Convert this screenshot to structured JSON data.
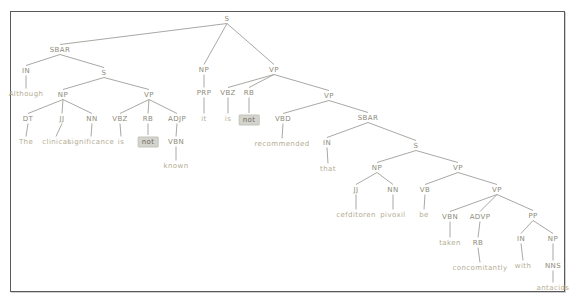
{
  "diagram": {
    "type": "constituency-parse-tree",
    "sentence": "Although The clinical significance is not known it is not recommended that cefditoren pivoxil be taken concomitantly with antacids",
    "highlighted_words": [
      "not",
      "not"
    ],
    "colors": {
      "phrase_label": "#8d8a79",
      "leaf_word": "#b4ac93",
      "highlight_background": "#d4d4cf",
      "highlight_text": "#6e6857",
      "edge": "#a8a8a4",
      "frame_border": "#5a5a5a",
      "background": "#ffffff"
    },
    "nodes": [
      {
        "id": "s-root",
        "label": "S",
        "kind": "phrase",
        "x": 227,
        "y": 19,
        "parent": null
      },
      {
        "id": "sbar-1",
        "label": "SBAR",
        "kind": "phrase",
        "x": 60,
        "y": 50,
        "parent": "s-root"
      },
      {
        "id": "np-it",
        "label": "NP",
        "kind": "phrase",
        "x": 204,
        "y": 70,
        "parent": "s-root"
      },
      {
        "id": "vp-main",
        "label": "VP",
        "kind": "phrase",
        "x": 274,
        "y": 70,
        "parent": "s-root"
      },
      {
        "id": "in-1",
        "label": "IN",
        "kind": "pos",
        "x": 26,
        "y": 71,
        "parent": "sbar-1"
      },
      {
        "id": "s-1",
        "label": "S",
        "kind": "phrase",
        "x": 104,
        "y": 73,
        "parent": "sbar-1"
      },
      {
        "id": "w-although",
        "label": "Although",
        "kind": "word",
        "x": 26,
        "y": 94,
        "parent": "in-1"
      },
      {
        "id": "np-1",
        "label": "NP",
        "kind": "phrase",
        "x": 63,
        "y": 95,
        "parent": "s-1"
      },
      {
        "id": "vp-1",
        "label": "VP",
        "kind": "phrase",
        "x": 149,
        "y": 95,
        "parent": "s-1"
      },
      {
        "id": "dt-1",
        "label": "DT",
        "kind": "pos",
        "x": 28,
        "y": 119,
        "parent": "np-1"
      },
      {
        "id": "jj-1",
        "label": "JJ",
        "kind": "pos",
        "x": 62,
        "y": 119,
        "parent": "np-1"
      },
      {
        "id": "nn-1",
        "label": "NN",
        "kind": "pos",
        "x": 92,
        "y": 119,
        "parent": "np-1"
      },
      {
        "id": "w-the",
        "label": "The",
        "kind": "word",
        "x": 26,
        "y": 142,
        "parent": "dt-1"
      },
      {
        "id": "w-clinical",
        "label": "clinical",
        "kind": "word",
        "x": 56,
        "y": 142,
        "parent": "jj-1"
      },
      {
        "id": "w-significance",
        "label": "significance",
        "kind": "word",
        "x": 91,
        "y": 142,
        "parent": "nn-1"
      },
      {
        "id": "vbz-1",
        "label": "VBZ",
        "kind": "pos",
        "x": 120,
        "y": 119,
        "parent": "vp-1"
      },
      {
        "id": "rb-1",
        "label": "RB",
        "kind": "pos",
        "x": 148,
        "y": 119,
        "parent": "vp-1"
      },
      {
        "id": "adjp-1",
        "label": "ADJP",
        "kind": "phrase",
        "x": 177,
        "y": 119,
        "parent": "vp-1"
      },
      {
        "id": "w-is-1",
        "label": "is",
        "kind": "word",
        "x": 121,
        "y": 142,
        "parent": "vbz-1"
      },
      {
        "id": "w-not-1",
        "label": "not",
        "kind": "word",
        "x": 148,
        "y": 142,
        "parent": "rb-1",
        "highlight": true
      },
      {
        "id": "vbn-1",
        "label": "VBN",
        "kind": "pos",
        "x": 176,
        "y": 142,
        "parent": "adjp-1"
      },
      {
        "id": "w-known",
        "label": "known",
        "kind": "word",
        "x": 176,
        "y": 166,
        "parent": "vbn-1"
      },
      {
        "id": "prp-1",
        "label": "PRP",
        "kind": "pos",
        "x": 204,
        "y": 93,
        "parent": "np-it"
      },
      {
        "id": "w-it",
        "label": "it",
        "kind": "word",
        "x": 204,
        "y": 119,
        "parent": "prp-1"
      },
      {
        "id": "vbz-2",
        "label": "VBZ",
        "kind": "pos",
        "x": 228,
        "y": 93,
        "parent": "vp-main"
      },
      {
        "id": "rb-2",
        "label": "RB",
        "kind": "pos",
        "x": 249,
        "y": 93,
        "parent": "vp-main"
      },
      {
        "id": "vp-2",
        "label": "VP",
        "kind": "phrase",
        "x": 329,
        "y": 96,
        "parent": "vp-main"
      },
      {
        "id": "w-is-2",
        "label": "is",
        "kind": "word",
        "x": 228,
        "y": 119,
        "parent": "vbz-2"
      },
      {
        "id": "w-not-2",
        "label": "not",
        "kind": "word",
        "x": 249,
        "y": 120,
        "parent": "rb-2",
        "highlight": true
      },
      {
        "id": "vbd-1",
        "label": "VBD",
        "kind": "pos",
        "x": 283,
        "y": 119,
        "parent": "vp-2"
      },
      {
        "id": "sbar-2",
        "label": "SBAR",
        "kind": "phrase",
        "x": 368,
        "y": 118,
        "parent": "vp-2"
      },
      {
        "id": "w-recommended",
        "label": "recommended",
        "kind": "word",
        "x": 282,
        "y": 144,
        "parent": "vbd-1"
      },
      {
        "id": "in-2",
        "label": "IN",
        "kind": "pos",
        "x": 327,
        "y": 143,
        "parent": "sbar-2"
      },
      {
        "id": "s-2",
        "label": "S",
        "kind": "phrase",
        "x": 416,
        "y": 146,
        "parent": "sbar-2"
      },
      {
        "id": "w-that",
        "label": "that",
        "kind": "word",
        "x": 328,
        "y": 169,
        "parent": "in-2"
      },
      {
        "id": "np-2",
        "label": "NP",
        "kind": "phrase",
        "x": 377,
        "y": 168,
        "parent": "s-2"
      },
      {
        "id": "vp-3",
        "label": "VP",
        "kind": "phrase",
        "x": 458,
        "y": 168,
        "parent": "s-2"
      },
      {
        "id": "jj-2",
        "label": "JJ",
        "kind": "pos",
        "x": 356,
        "y": 190,
        "parent": "np-2"
      },
      {
        "id": "nn-2",
        "label": "NN",
        "kind": "pos",
        "x": 393,
        "y": 190,
        "parent": "np-2"
      },
      {
        "id": "w-cefditoren",
        "label": "cefditoren",
        "kind": "word",
        "x": 356,
        "y": 215,
        "parent": "jj-2"
      },
      {
        "id": "w-pivoxil",
        "label": "pivoxil",
        "kind": "word",
        "x": 393,
        "y": 215,
        "parent": "nn-2"
      },
      {
        "id": "vb-1",
        "label": "VB",
        "kind": "pos",
        "x": 425,
        "y": 190,
        "parent": "vp-3"
      },
      {
        "id": "vp-4",
        "label": "VP",
        "kind": "phrase",
        "x": 497,
        "y": 190,
        "parent": "vp-3"
      },
      {
        "id": "w-be",
        "label": "be",
        "kind": "word",
        "x": 424,
        "y": 215,
        "parent": "vb-1"
      },
      {
        "id": "vbn-2",
        "label": "VBN",
        "kind": "pos",
        "x": 450,
        "y": 217,
        "parent": "vp-4"
      },
      {
        "id": "advp-1",
        "label": "ADVP",
        "kind": "phrase",
        "x": 480,
        "y": 217,
        "parent": "vp-4"
      },
      {
        "id": "pp-1",
        "label": "PP",
        "kind": "phrase",
        "x": 533,
        "y": 216,
        "parent": "vp-4"
      },
      {
        "id": "w-taken",
        "label": "taken",
        "kind": "word",
        "x": 450,
        "y": 243,
        "parent": "vbn-2"
      },
      {
        "id": "rb-3",
        "label": "RB",
        "kind": "pos",
        "x": 478,
        "y": 243,
        "parent": "advp-1"
      },
      {
        "id": "w-concomitantly",
        "label": "concomitantly",
        "kind": "word",
        "x": 480,
        "y": 268,
        "parent": "rb-3"
      },
      {
        "id": "in-3",
        "label": "IN",
        "kind": "pos",
        "x": 521,
        "y": 239,
        "parent": "pp-1"
      },
      {
        "id": "np-3",
        "label": "NP",
        "kind": "phrase",
        "x": 553,
        "y": 239,
        "parent": "pp-1"
      },
      {
        "id": "w-with",
        "label": "with",
        "kind": "word",
        "x": 523,
        "y": 266,
        "parent": "in-3"
      },
      {
        "id": "nns-1",
        "label": "NNS",
        "kind": "pos",
        "x": 553,
        "y": 266,
        "parent": "np-3"
      },
      {
        "id": "w-antacids",
        "label": "antacids",
        "kind": "word",
        "x": 553,
        "y": 288,
        "parent": "nns-1"
      }
    ]
  }
}
